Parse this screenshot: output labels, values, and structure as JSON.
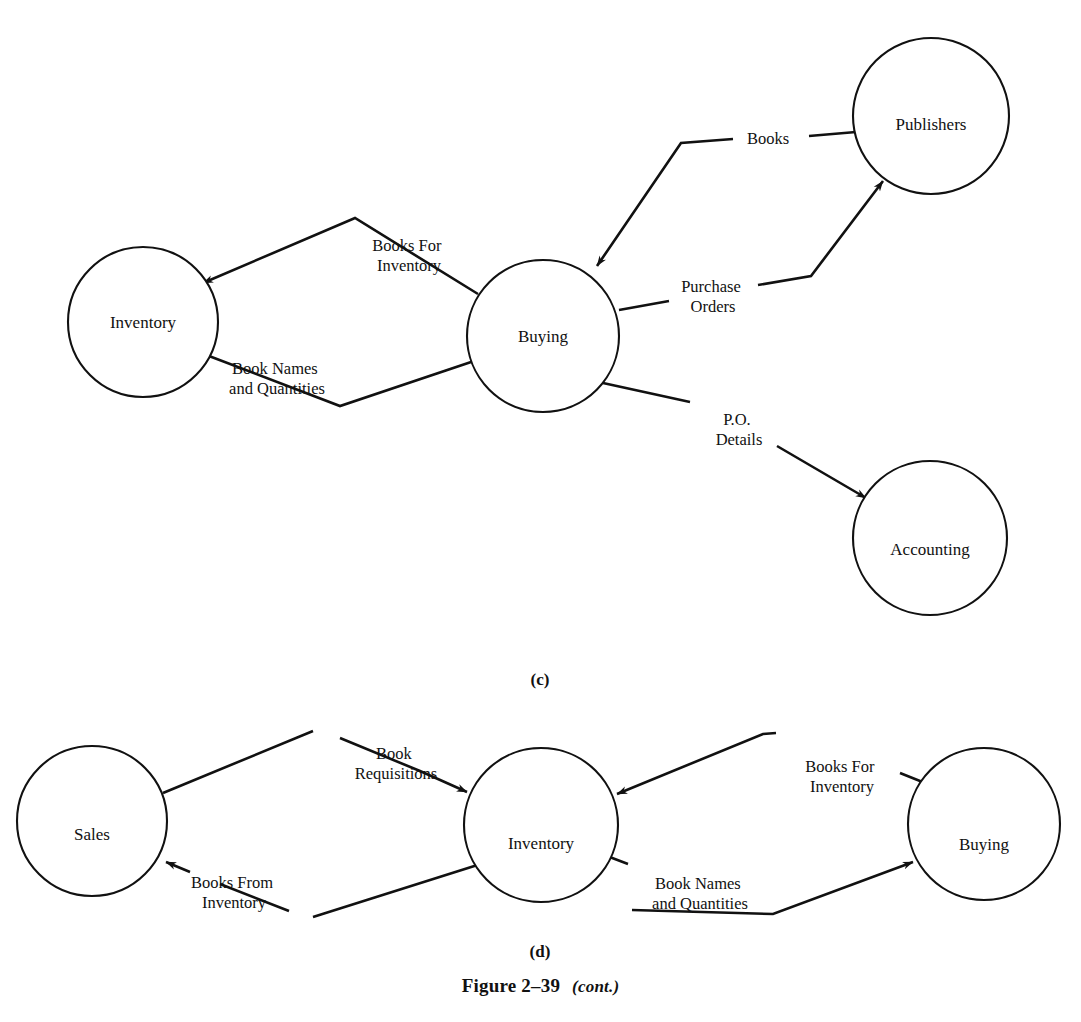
{
  "figure": {
    "caption_main": "Figure 2–39",
    "caption_cont": "(cont.)"
  },
  "parts": [
    {
      "id": "c",
      "label": "(c)",
      "nodes": [
        {
          "id": "inventory",
          "label": "Inventory",
          "cx": 143,
          "cy": 322,
          "r": 75
        },
        {
          "id": "buying",
          "label": "Buying",
          "cx": 543,
          "cy": 336,
          "r": 76
        },
        {
          "id": "publishers",
          "label": "Publishers",
          "cx": 931,
          "cy": 116,
          "r": 78
        },
        {
          "id": "accounting",
          "label": "Accounting",
          "cx": 930,
          "cy": 538,
          "r": 77
        }
      ],
      "flows": [
        {
          "id": "books-for-inventory",
          "label": "Books For\nInventory",
          "from": "buying",
          "to": "inventory",
          "label_x": 409,
          "label_y": 251
        },
        {
          "id": "book-names-and-quantities",
          "label": "Book Names\nand Quantities",
          "from": "inventory",
          "to": "buying",
          "label_x": 277,
          "label_y": 374
        },
        {
          "id": "books",
          "label": "Books",
          "from": "publishers",
          "to": "buying",
          "label_x": 768,
          "label_y": 144
        },
        {
          "id": "purchase-orders",
          "label": "Purchase\nOrders",
          "from": "buying",
          "to": "publishers",
          "label_x": 713,
          "label_y": 292
        },
        {
          "id": "po-details",
          "label": "P.O.\nDetails",
          "from": "buying",
          "to": "accounting",
          "label_x": 739,
          "label_y": 425
        }
      ]
    },
    {
      "id": "d",
      "label": "(d)",
      "nodes": [
        {
          "id": "sales",
          "label": "Sales",
          "cx": 92,
          "cy": 821,
          "r": 75
        },
        {
          "id": "inventory",
          "label": "Inventory",
          "cx": 541,
          "cy": 825,
          "r": 77
        },
        {
          "id": "buying",
          "label": "Buying",
          "cx": 984,
          "cy": 824,
          "r": 76
        }
      ],
      "flows": [
        {
          "id": "book-requisitions",
          "label": "Book\nRequisitions",
          "from": "sales",
          "to": "inventory",
          "label_x": 396,
          "label_y": 759
        },
        {
          "id": "books-from-inventory",
          "label": "Books From\nInventory",
          "from": "inventory",
          "to": "sales",
          "label_x": 234,
          "label_y": 888
        },
        {
          "id": "books-for-inventory",
          "label": "Books For\nInventory",
          "from": "buying",
          "to": "inventory",
          "label_x": 842,
          "label_y": 772
        },
        {
          "id": "book-names-and-quantities",
          "label": "Book Names\nand Quantities",
          "from": "inventory",
          "to": "buying",
          "label_x": 700,
          "label_y": 889
        }
      ]
    }
  ]
}
